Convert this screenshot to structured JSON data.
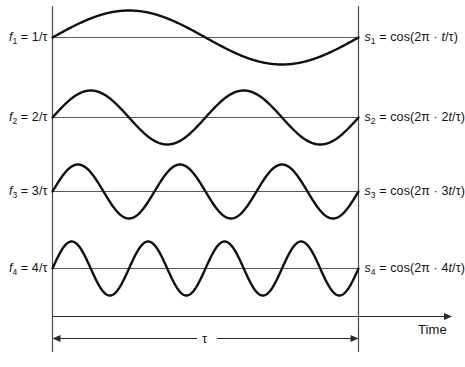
{
  "figure": {
    "axis": {
      "time_axis_label": "Time",
      "duration_label": "τ"
    },
    "colors": {
      "curve": "#101010",
      "baseline": "#5a5a5a",
      "frame": "#4a4a4a",
      "background": "#ffffff",
      "text": "#111111"
    },
    "rows": [
      {
        "index": 1,
        "freq_label_html": "<span class=\"it\">f</span><sub>1</sub> = 1/τ",
        "freq_label_text": "f1 = 1/τ",
        "signal_label_html": "<span class=\"it\">s</span><sub>1</sub> = cos(2π · <span class=\"it\">t</span>/τ)",
        "signal_label_text": "s1 = cos(2π · t/τ)",
        "cycles": 1,
        "baseline_y": 37.5,
        "amplitude": 27
      },
      {
        "index": 2,
        "freq_label_html": "<span class=\"it\">f</span><sub>2</sub> = 2/τ",
        "freq_label_text": "f2 = 2/τ",
        "signal_label_html": "<span class=\"it\">s</span><sub>2</sub> = cos(2π · 2<span class=\"it\">t</span>/τ)",
        "signal_label_text": "s2 = cos(2π · 2t/τ)",
        "cycles": 2,
        "baseline_y": 117.5,
        "amplitude": 27
      },
      {
        "index": 3,
        "freq_label_html": "<span class=\"it\">f</span><sub>3</sub> = 3/τ",
        "freq_label_text": "f3 = 3/τ",
        "signal_label_html": "<span class=\"it\">s</span><sub>3</sub> = cos(2π · 3<span class=\"it\">t</span>/τ)",
        "signal_label_text": "s3 = cos(2π · 3t/τ)",
        "cycles": 3,
        "baseline_y": 191.5,
        "amplitude": 27
      },
      {
        "index": 4,
        "freq_label_html": "<span class=\"it\">f</span><sub>4</sub> = 4/τ",
        "freq_label_text": "f4 = 4/τ",
        "signal_label_html": "<span class=\"it\">s</span><sub>4</sub> = cos(2π · 4<span class=\"it\">t</span>/τ)",
        "signal_label_text": "s4 = cos(2π · 4t/τ)",
        "cycles": 4,
        "baseline_y": 268.5,
        "amplitude": 27
      }
    ]
  },
  "chart_data": {
    "type": "line",
    "xlabel": "Time",
    "ylabel": "",
    "x": [
      0,
      1
    ],
    "xlim": [
      0,
      1
    ],
    "ylim": [
      -1,
      1
    ],
    "grid": false,
    "legend": "right",
    "annotations": [
      "τ",
      "Time"
    ],
    "series": [
      {
        "name": "s1 = cos(2π · t/τ)",
        "frequency": "1/τ",
        "cycles_in_tau": 1,
        "amplitude": 1
      },
      {
        "name": "s2 = cos(2π · 2t/τ)",
        "frequency": "2/τ",
        "cycles_in_tau": 2,
        "amplitude": 1
      },
      {
        "name": "s3 = cos(2π · 3t/τ)",
        "frequency": "3/τ",
        "cycles_in_tau": 3,
        "amplitude": 1
      },
      {
        "name": "s4 = cos(2π · 4t/τ)",
        "frequency": "4/τ",
        "cycles_in_tau": 4,
        "amplitude": 1
      }
    ]
  }
}
